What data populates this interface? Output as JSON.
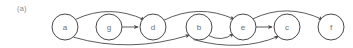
{
  "figure": {
    "panel_label": "(a)",
    "width": 353,
    "height": 48,
    "background_color": "#ffffff",
    "node_stroke_color": "#4a4a4a",
    "node_fill_color": "#ffffff",
    "edge_color": "#4a4a4a",
    "label_color": "#6d6d6d",
    "panel_label_color": "#8a8a8a"
  },
  "graph": {
    "type": "directed-graph",
    "node_radius": 13,
    "baseline_y": 27,
    "nodes": [
      {
        "id": "a",
        "label": "a",
        "cx": 65,
        "cy": 27
      },
      {
        "id": "g",
        "label": "g",
        "cx": 109,
        "cy": 27
      },
      {
        "id": "d",
        "label": "d",
        "cx": 153,
        "cy": 27
      },
      {
        "id": "b",
        "label": "b",
        "cx": 199,
        "cy": 27
      },
      {
        "id": "e",
        "label": "e",
        "cx": 243,
        "cy": 27
      },
      {
        "id": "c",
        "label": "c",
        "cx": 287,
        "cy": 27
      },
      {
        "id": "f",
        "label": "f",
        "cx": 331,
        "cy": 27
      }
    ],
    "edges": [
      {
        "from": "a",
        "to": "d",
        "style": "arc-above"
      },
      {
        "from": "a",
        "to": "b",
        "style": "arc-below"
      },
      {
        "from": "g",
        "to": "d",
        "style": "straight"
      },
      {
        "from": "d",
        "to": "e",
        "style": "arc-above"
      },
      {
        "from": "b",
        "to": "e",
        "style": "arc-below"
      },
      {
        "from": "b",
        "to": "c",
        "style": "arc-below"
      },
      {
        "from": "e",
        "to": "c",
        "style": "straight"
      },
      {
        "from": "e",
        "to": "f",
        "style": "arc-above"
      }
    ]
  }
}
